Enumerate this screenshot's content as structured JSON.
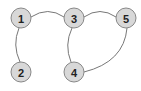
{
  "diagram": {
    "type": "undirected-graph",
    "colors": {
      "node_fill": "#d8d8d8",
      "node_stroke": "#888888",
      "edge": "#777777",
      "label": "#222222"
    },
    "nodes": [
      {
        "id": "1",
        "label": "1",
        "x": 21,
        "y": 18
      },
      {
        "id": "2",
        "label": "2",
        "x": 21,
        "y": 72
      },
      {
        "id": "3",
        "label": "3",
        "x": 74,
        "y": 18
      },
      {
        "id": "4",
        "label": "4",
        "x": 74,
        "y": 72
      },
      {
        "id": "5",
        "label": "5",
        "x": 126,
        "y": 18
      }
    ],
    "edges": [
      {
        "from": "1",
        "to": "3"
      },
      {
        "from": "1",
        "to": "2"
      },
      {
        "from": "3",
        "to": "5"
      },
      {
        "from": "3",
        "to": "4"
      },
      {
        "from": "5",
        "to": "4"
      }
    ]
  }
}
